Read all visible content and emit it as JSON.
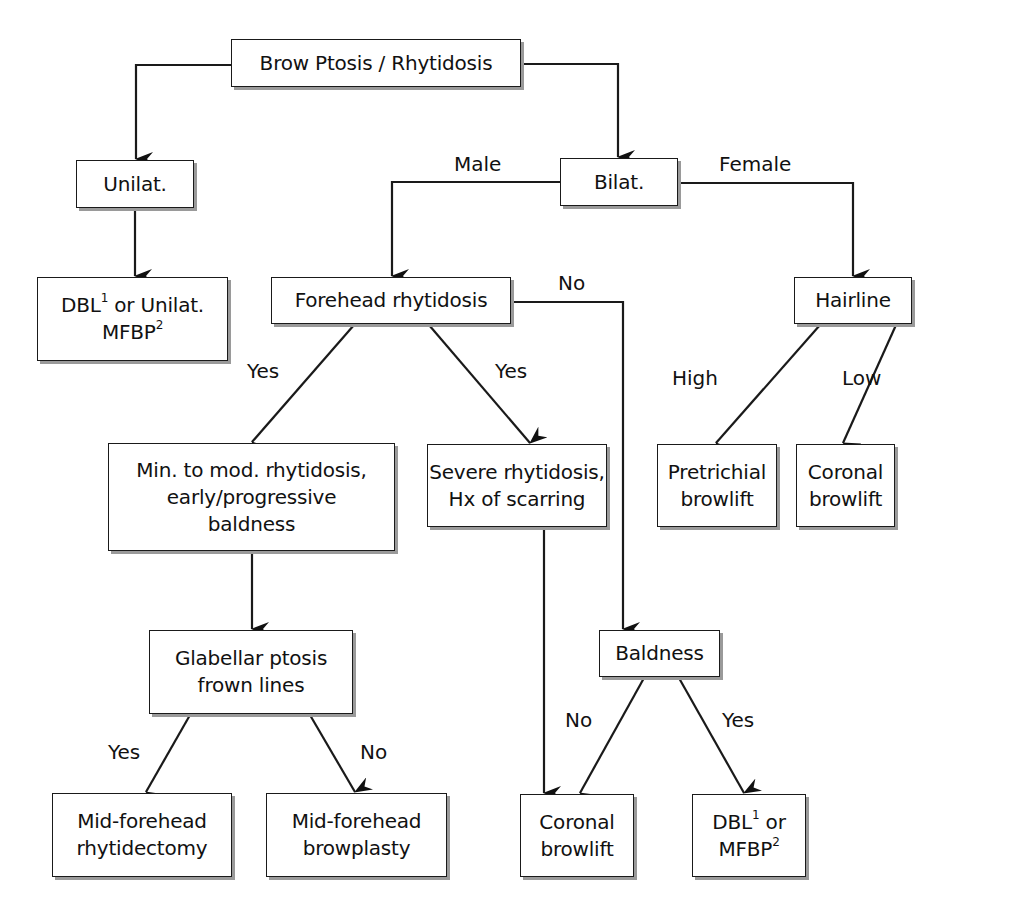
{
  "diagram": {
    "type": "flowchart",
    "nodes": [
      {
        "id": "root",
        "lines": [
          "Brow Ptosis / Rhytidosis"
        ],
        "box": [
          231,
          39,
          290,
          48
        ]
      },
      {
        "id": "unilat",
        "lines": [
          "Unilat."
        ],
        "box": [
          76,
          160,
          118,
          48
        ]
      },
      {
        "id": "bilat",
        "lines": [
          "Bilat."
        ],
        "box": [
          560,
          158,
          118,
          48
        ]
      },
      {
        "id": "unilat_treatment",
        "lines": [
          "DBL",
          "1",
          " or Unilat.",
          "MFBP",
          "2"
        ],
        "text_line1": "DBL",
        "sup1": "1",
        "text_line1_rest": " or Unilat.",
        "text_line2": "MFBP",
        "sup2": "2",
        "box": [
          37,
          277,
          191,
          84
        ]
      },
      {
        "id": "forehead_rhytidosis",
        "lines": [
          "Forehead rhytidosis"
        ],
        "box": [
          271,
          277,
          240,
          47
        ]
      },
      {
        "id": "hairline",
        "lines": [
          "Hairline"
        ],
        "box": [
          794,
          277,
          118,
          47
        ]
      },
      {
        "id": "min_mod",
        "lines": [
          "Min. to mod. rhytidosis,",
          "early/progressive",
          "baldness"
        ],
        "box": [
          108,
          443,
          287,
          108
        ]
      },
      {
        "id": "severe",
        "lines": [
          "Severe rhytidosis,",
          "Hx of scarring"
        ],
        "box": [
          427,
          444,
          180,
          83
        ]
      },
      {
        "id": "pretrichial",
        "lines": [
          "Pretrichial",
          "browlift"
        ],
        "box": [
          657,
          444,
          120,
          83
        ]
      },
      {
        "id": "coronal_female",
        "lines": [
          "Coronal",
          "browlift"
        ],
        "box": [
          796,
          444,
          99,
          83
        ]
      },
      {
        "id": "glabellar",
        "lines": [
          "Glabellar ptosis",
          "frown lines"
        ],
        "box": [
          149,
          630,
          204,
          84
        ]
      },
      {
        "id": "baldness",
        "lines": [
          "Baldness"
        ],
        "box": [
          599,
          630,
          121,
          47
        ]
      },
      {
        "id": "mid_rhytidectomy",
        "lines": [
          "Mid-forehead",
          "rhytidectomy"
        ],
        "box": [
          52,
          793,
          180,
          84
        ]
      },
      {
        "id": "mid_browplasty",
        "lines": [
          "Mid-forehead",
          "browplasty"
        ],
        "box": [
          266,
          793,
          181,
          84
        ]
      },
      {
        "id": "coronal_male",
        "lines": [
          "Coronal",
          "browlift"
        ],
        "box": [
          520,
          794,
          114,
          83
        ]
      },
      {
        "id": "dbl_mfbp",
        "lines": [
          "DBL",
          "1",
          " or",
          "MFBP",
          "2"
        ],
        "text_line1": "DBL",
        "sup1": "1",
        "text_line1_rest": " or",
        "text_line2": "MFBP",
        "sup2": "2",
        "box": [
          692,
          794,
          114,
          83
        ]
      }
    ],
    "edge_labels": [
      {
        "text": "Male",
        "pos": [
          454,
          152
        ]
      },
      {
        "text": "Female",
        "pos": [
          719,
          152
        ]
      },
      {
        "text": "No",
        "pos": [
          558,
          271
        ]
      },
      {
        "text": "Yes",
        "pos": [
          247,
          359
        ]
      },
      {
        "text": "Yes",
        "pos": [
          495,
          359
        ]
      },
      {
        "text": "High",
        "pos": [
          672,
          366
        ]
      },
      {
        "text": "Low",
        "pos": [
          842,
          366
        ]
      },
      {
        "text": "Yes",
        "pos": [
          108,
          740
        ]
      },
      {
        "text": "No",
        "pos": [
          360,
          740
        ]
      },
      {
        "text": "No",
        "pos": [
          565,
          708
        ]
      },
      {
        "text": "Yes",
        "pos": [
          722,
          708
        ]
      }
    ],
    "edges": [
      {
        "from": "root",
        "to": "unilat",
        "points": [
          [
            231,
            65
          ],
          [
            136,
            65
          ],
          [
            136,
            159
          ]
        ]
      },
      {
        "from": "root",
        "to": "bilat",
        "points": [
          [
            521,
            64
          ],
          [
            618,
            64
          ],
          [
            618,
            157
          ]
        ]
      },
      {
        "from": "unilat",
        "to": "unilat_treatment",
        "points": [
          [
            135,
            208
          ],
          [
            135,
            276
          ]
        ]
      },
      {
        "from": "bilat",
        "to": "forehead_rhytidosis",
        "label": "Male",
        "points": [
          [
            560,
            182
          ],
          [
            392,
            182
          ],
          [
            392,
            276
          ]
        ]
      },
      {
        "from": "bilat",
        "to": "hairline",
        "label": "Female",
        "points": [
          [
            678,
            183
          ],
          [
            853,
            183
          ],
          [
            853,
            276
          ]
        ]
      },
      {
        "from": "forehead_rhytidosis",
        "to": "min_mod",
        "label": "Yes",
        "points": [
          [
            354,
            325
          ],
          [
            252,
            442
          ]
        ]
      },
      {
        "from": "forehead_rhytidosis",
        "to": "severe",
        "label": "Yes",
        "points": [
          [
            429,
            325
          ],
          [
            530,
            443
          ]
        ]
      },
      {
        "from": "forehead_rhytidosis",
        "to": "baldness",
        "label": "No",
        "points": [
          [
            511,
            302
          ],
          [
            623,
            302
          ],
          [
            623,
            629
          ]
        ]
      },
      {
        "from": "hairline",
        "to": "pretrichial",
        "label": "High",
        "points": [
          [
            820,
            325
          ],
          [
            716,
            443
          ]
        ]
      },
      {
        "from": "hairline",
        "to": "coronal_female",
        "label": "Low",
        "points": [
          [
            896,
            325
          ],
          [
            843,
            443
          ]
        ]
      },
      {
        "from": "min_mod",
        "to": "glabellar",
        "points": [
          [
            252,
            551
          ],
          [
            252,
            629
          ]
        ]
      },
      {
        "from": "severe",
        "to": "coronal_male",
        "points": [
          [
            544,
            527
          ],
          [
            544,
            793
          ]
        ]
      },
      {
        "from": "glabellar",
        "to": "mid_rhytidectomy",
        "label": "Yes",
        "points": [
          [
            190,
            715
          ],
          [
            146,
            792
          ]
        ]
      },
      {
        "from": "glabellar",
        "to": "mid_browplasty",
        "label": "No",
        "points": [
          [
            310,
            715
          ],
          [
            355,
            792
          ]
        ]
      },
      {
        "from": "baldness",
        "to": "coronal_male",
        "label": "No",
        "points": [
          [
            644,
            678
          ],
          [
            580,
            793
          ]
        ]
      },
      {
        "from": "baldness",
        "to": "dbl_mfbp",
        "label": "Yes",
        "points": [
          [
            679,
            678
          ],
          [
            744,
            793
          ]
        ]
      }
    ],
    "colors": {
      "stroke": "#1a1a1a",
      "shadow": "#9a9a9a",
      "background": "#ffffff"
    }
  }
}
